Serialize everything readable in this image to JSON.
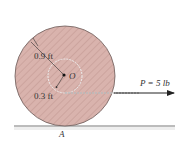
{
  "diagram": {
    "outer_radius_label": "0.9 ft",
    "inner_radius_label": "0.3 ft",
    "center_label": "O",
    "contact_label": "A",
    "force_label": "P = 5 lb",
    "colors": {
      "disk_fill": "#d9b3ad",
      "hatch": "#c49a94",
      "outline": "#6b5a58",
      "rope": "#9a9a9a",
      "arrow": "#222222",
      "ground": "#555555"
    }
  }
}
